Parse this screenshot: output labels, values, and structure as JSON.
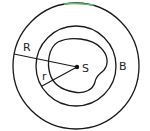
{
  "diagram": {
    "labels": {
      "outer_radius": "R",
      "inner_radius": "r",
      "center_point": "S",
      "boundary": "B"
    },
    "colors": {
      "stroke": "#1a1a1a",
      "background": "#ffffff",
      "top_accent": "#5fbf6a"
    }
  }
}
